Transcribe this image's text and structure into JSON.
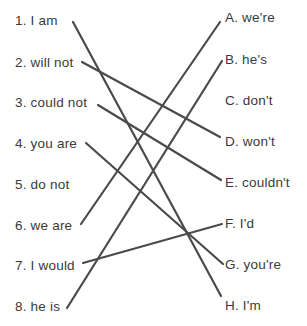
{
  "left_items": [
    {
      "label": "1. I am",
      "x": 15,
      "y": 13
    },
    {
      "label": "2. will not",
      "x": 15,
      "y": 55
    },
    {
      "label": "3. could not",
      "x": 15,
      "y": 95
    },
    {
      "label": "4. you are",
      "x": 15,
      "y": 136
    },
    {
      "label": "5. do not",
      "x": 15,
      "y": 177
    },
    {
      "label": "6. we are",
      "x": 15,
      "y": 218
    },
    {
      "label": "7. I would",
      "x": 15,
      "y": 258
    },
    {
      "label": "8. he is",
      "x": 15,
      "y": 299
    }
  ],
  "right_items": [
    {
      "label": "A. we're",
      "x": 225,
      "y": 10
    },
    {
      "label": "B. he's",
      "x": 225,
      "y": 52
    },
    {
      "label": "C. don't",
      "x": 225,
      "y": 93
    },
    {
      "label": "D. won't",
      "x": 225,
      "y": 134
    },
    {
      "label": "E. couldn't",
      "x": 225,
      "y": 175
    },
    {
      "label": "F. I'd",
      "x": 225,
      "y": 216
    },
    {
      "label": "G. you're",
      "x": 225,
      "y": 257
    },
    {
      "label": "H. I'm",
      "x": 225,
      "y": 298
    }
  ],
  "matches": [
    {
      "from": "1. I am",
      "to": "H. I'm",
      "x1": 73,
      "y1": 22,
      "x2": 221,
      "y2": 296
    },
    {
      "from": "2. will not",
      "to": "D. won't",
      "x1": 82,
      "y1": 62,
      "x2": 220,
      "y2": 137
    },
    {
      "from": "3. could not",
      "to": "E. couldn't",
      "x1": 98,
      "y1": 105,
      "x2": 221,
      "y2": 180
    },
    {
      "from": "4. you are",
      "to": "G. you're",
      "x1": 86,
      "y1": 143,
      "x2": 223,
      "y2": 264
    },
    {
      "from": "6. we are",
      "to": "A. we're",
      "x1": 81,
      "y1": 224,
      "x2": 220,
      "y2": 22
    },
    {
      "from": "7. I would",
      "to": "F. I'd",
      "x1": 83,
      "y1": 263,
      "x2": 222,
      "y2": 224
    },
    {
      "from": "8. he is",
      "to": "B. he's",
      "x1": 67,
      "y1": 308,
      "x2": 222,
      "y2": 61
    }
  ]
}
